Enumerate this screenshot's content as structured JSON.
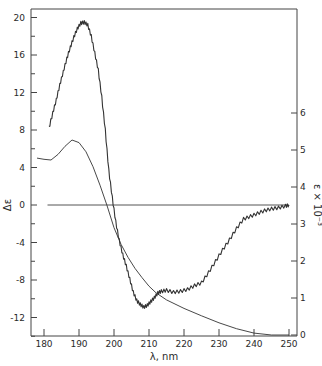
{
  "chart_data": {
    "type": "line",
    "title": "",
    "xlabel": "λ, nm",
    "ylabel": "Δε",
    "y2label": "ε × 10⁻³",
    "xlim": [
      177,
      252
    ],
    "ylim": [
      -14,
      21
    ],
    "y2lim": [
      0,
      8.8
    ],
    "x_ticks": [
      180,
      190,
      200,
      210,
      220,
      230,
      240,
      250
    ],
    "y_ticks": [
      20,
      16,
      12,
      8,
      4,
      0,
      -4,
      -8,
      -12
    ],
    "y_tick_labels": [
      "20",
      "16",
      "12",
      "8",
      "4",
      "0",
      "-4",
      "-8",
      "-12"
    ],
    "y2_ticks": [
      0,
      1,
      2,
      3,
      4,
      5,
      6
    ],
    "grid": false,
    "legend": null,
    "zero_line": {
      "y": 0,
      "x_from": 181,
      "x_to": 250
    },
    "series": [
      {
        "name": "CD (Δε)",
        "axis": "left",
        "noisy": true,
        "x": [
          181.4,
          182.5,
          183.5,
          184.5,
          185.5,
          186.5,
          187.5,
          188.5,
          189.5,
          190.5,
          191.5,
          192.5,
          193.5,
          194.5,
          195.5,
          196.5,
          197.5,
          198.5,
          199.5,
          200.5,
          201.5,
          202.5,
          203.5,
          204.5,
          205.5,
          206.5,
          207.5,
          208.5,
          209.5,
          210.5,
          211.5,
          212.5,
          213.5,
          215,
          217,
          219,
          221,
          223,
          225,
          227,
          229,
          231,
          233,
          235,
          237,
          239,
          241,
          243,
          245,
          247,
          249,
          250
        ],
        "values": [
          8.2,
          9.8,
          11.2,
          12.8,
          14.2,
          15.6,
          16.8,
          17.9,
          18.8,
          19.4,
          19.5,
          19.2,
          18.0,
          16.2,
          14.4,
          11.5,
          8.0,
          3.7,
          0.8,
          -1.8,
          -3.8,
          -5.3,
          -6.5,
          -7.9,
          -9.3,
          -10.2,
          -10.6,
          -10.9,
          -10.7,
          -10.3,
          -9.9,
          -9.4,
          -9.2,
          -9.1,
          -9.3,
          -9.2,
          -9.0,
          -8.6,
          -8.3,
          -7.2,
          -6.0,
          -4.8,
          -3.7,
          -2.5,
          -1.5,
          -1.2,
          -0.9,
          -0.6,
          -0.4,
          -0.3,
          -0.1,
          0.0
        ]
      },
      {
        "name": "Absorption (ε × 10⁻³)",
        "axis": "right",
        "noisy": false,
        "x": [
          178,
          180,
          182,
          184,
          186,
          188,
          190,
          192,
          194,
          196,
          198,
          200,
          202,
          204,
          206,
          208,
          210,
          212,
          215,
          220,
          225,
          230,
          235,
          240,
          245,
          250
        ],
        "values": [
          4.78,
          4.75,
          4.73,
          4.88,
          5.1,
          5.27,
          5.2,
          4.95,
          4.55,
          4.05,
          3.5,
          2.9,
          2.45,
          2.1,
          1.8,
          1.55,
          1.32,
          1.14,
          0.95,
          0.72,
          0.52,
          0.33,
          0.17,
          0.05,
          0.0,
          0.0
        ]
      }
    ]
  }
}
